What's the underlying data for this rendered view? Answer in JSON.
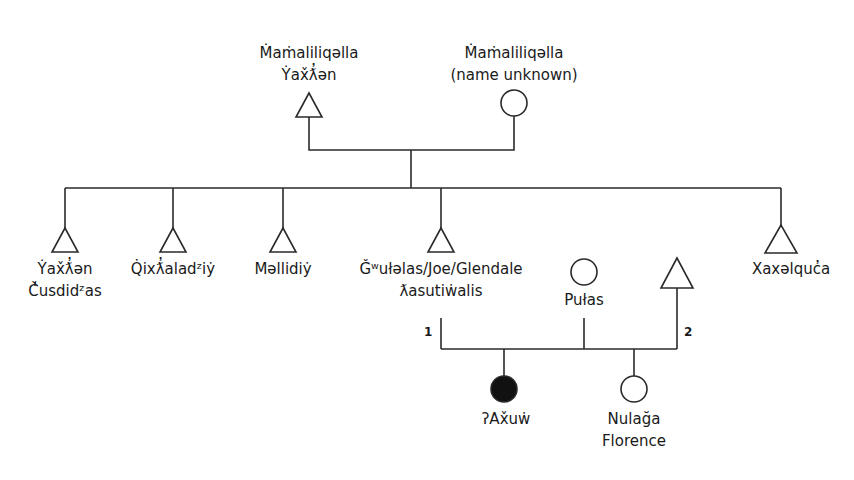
{
  "diagram": {
    "type": "kinship-chart",
    "legend_conventions": {
      "triangle": "male",
      "circle": "female",
      "filled": "ego"
    },
    "generation_1": {
      "father": {
        "line1": "Ṁaṁaliliqəlla",
        "line2": "Ẏax̌ƛ̓ən",
        "symbol": "triangle"
      },
      "mother": {
        "line1": "Ṁaṁaliliqəlla",
        "line2": "(name unknown)",
        "symbol": "circle"
      }
    },
    "generation_2": [
      {
        "line1": "Ẏax̌ƛ̓ən",
        "line2": "Č̓usdidᶻas",
        "symbol": "triangle"
      },
      {
        "line1": "Q̇ixƛ̓aladᶻiẏ",
        "line2": "",
        "symbol": "triangle"
      },
      {
        "line1": "Məllidiẏ",
        "line2": "",
        "symbol": "triangle"
      },
      {
        "line1": "Ǧʷułəlas/Joe/Glendale",
        "line2": "ƛasutiẇalis",
        "symbol": "triangle"
      },
      {
        "line1": "Xaxəlquc̓a",
        "line2": "",
        "symbol": "triangle"
      }
    ],
    "spouse": {
      "line1": "Pułas",
      "symbol": "circle"
    },
    "spouse_second_husband": {
      "symbol": "triangle"
    },
    "marriage_numbers": {
      "first": "1",
      "second": "2"
    },
    "generation_3": [
      {
        "line1": "ʔAx̌uẇ",
        "line2": "",
        "symbol": "circle-filled"
      },
      {
        "line1": "Nulağa",
        "line2": "Florence",
        "symbol": "circle"
      }
    ],
    "colors": {
      "line": "#2a2a2a",
      "fill_ego": "#111111",
      "background": "#ffffff"
    }
  }
}
